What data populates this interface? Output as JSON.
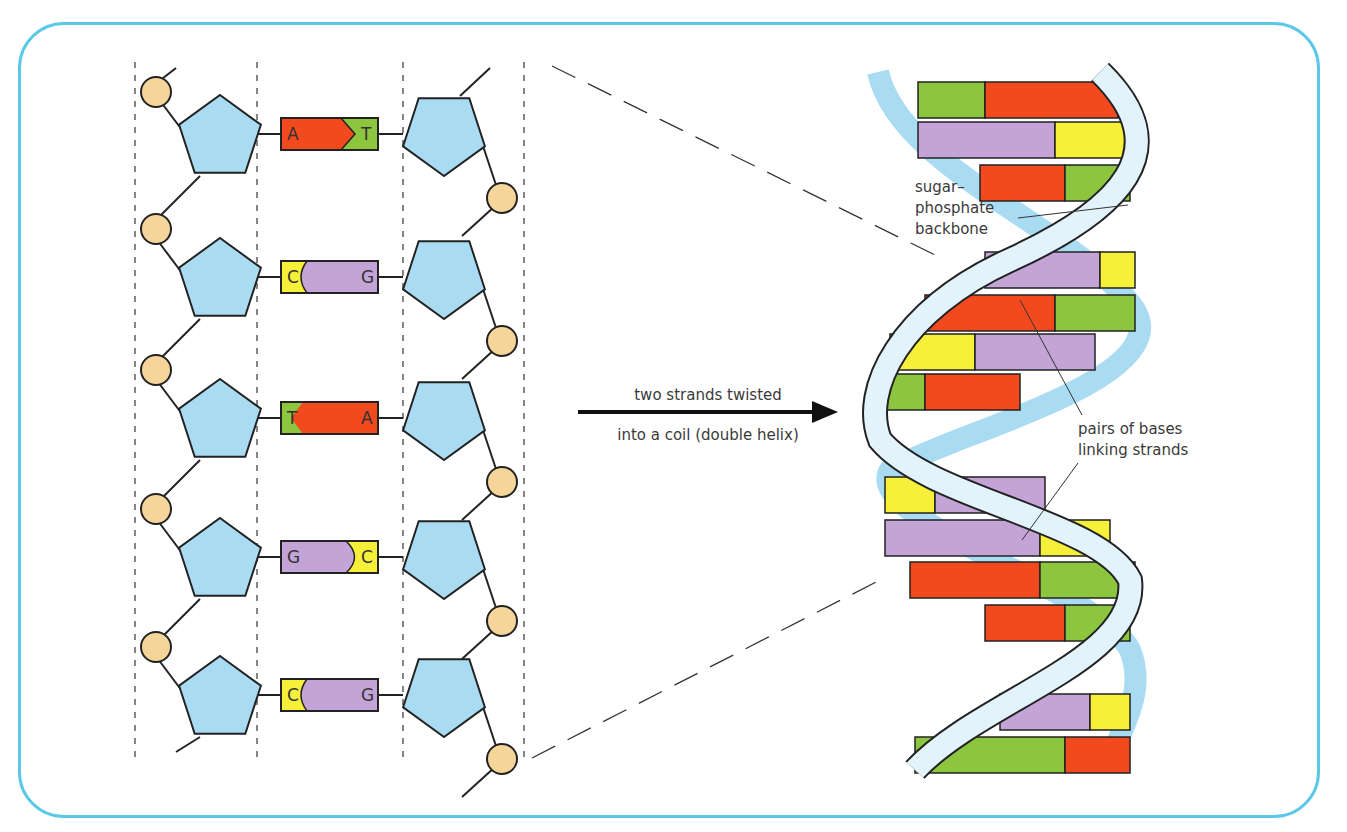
{
  "colors": {
    "frame": "#5cc8e8",
    "sugar": "#a9dcf3",
    "phosphate": "#f6d59a",
    "adenine": "#f24a1e",
    "thymine": "#8cc63f",
    "cytosine": "#f7f03a",
    "guanine": "#c4a3d6",
    "helix_strand_front": "#e3f3fb",
    "helix_strand_back": "#a9dcf3",
    "outline": "#222222"
  },
  "ladder": {
    "pairs": [
      {
        "left": "A",
        "right": "T",
        "left_base": "adenine",
        "right_base": "thymine"
      },
      {
        "left": "C",
        "right": "G",
        "left_base": "cytosine",
        "right_base": "guanine"
      },
      {
        "left": "T",
        "right": "A",
        "left_base": "thymine",
        "right_base": "adenine"
      },
      {
        "left": "G",
        "right": "C",
        "left_base": "guanine",
        "right_base": "cytosine"
      },
      {
        "left": "C",
        "right": "G",
        "left_base": "cytosine",
        "right_base": "guanine"
      }
    ]
  },
  "arrow": {
    "label_line1": "two strands twisted",
    "label_line2": "into a coil (double helix)"
  },
  "helix": {
    "label_backbone_1": "sugar–",
    "label_backbone_2": "phosphate",
    "label_backbone_3": "backbone",
    "label_bases_1": "pairs of bases",
    "label_bases_2": "linking strands",
    "rungs": [
      {
        "y": 100,
        "x1": 918,
        "x2": 1118,
        "split": 985,
        "l": "thymine",
        "r": "adenine"
      },
      {
        "y": 140,
        "x1": 918,
        "x2": 1138,
        "split": 1055,
        "l": "guanine",
        "r": "cytosine"
      },
      {
        "y": 183,
        "x1": 980,
        "x2": 1130,
        "split": 1065,
        "l": "adenine",
        "r": "thymine"
      },
      {
        "y": 270,
        "x1": 985,
        "x2": 1135,
        "split": 1100,
        "l": "guanine",
        "r": "cytosine"
      },
      {
        "y": 313,
        "x1": 925,
        "x2": 1135,
        "split": 1055,
        "l": "adenine",
        "r": "thymine"
      },
      {
        "y": 352,
        "x1": 890,
        "x2": 1095,
        "split": 975,
        "l": "cytosine",
        "r": "guanine"
      },
      {
        "y": 392,
        "x1": 885,
        "x2": 1020,
        "split": 925,
        "l": "thymine",
        "r": "adenine"
      },
      {
        "y": 495,
        "x1": 885,
        "x2": 1045,
        "split": 935,
        "l": "cytosine",
        "r": "guanine"
      },
      {
        "y": 538,
        "x1": 885,
        "x2": 1110,
        "split": 1040,
        "l": "guanine",
        "r": "cytosine"
      },
      {
        "y": 580,
        "x1": 910,
        "x2": 1135,
        "split": 1040,
        "l": "adenine",
        "r": "thymine"
      },
      {
        "y": 623,
        "x1": 985,
        "x2": 1130,
        "split": 1065,
        "l": "adenine",
        "r": "thymine"
      },
      {
        "y": 712,
        "x1": 1000,
        "x2": 1130,
        "split": 1090,
        "l": "guanine",
        "r": "cytosine"
      },
      {
        "y": 755,
        "x1": 915,
        "x2": 1130,
        "split": 1065,
        "l": "thymine",
        "r": "adenine"
      }
    ]
  }
}
